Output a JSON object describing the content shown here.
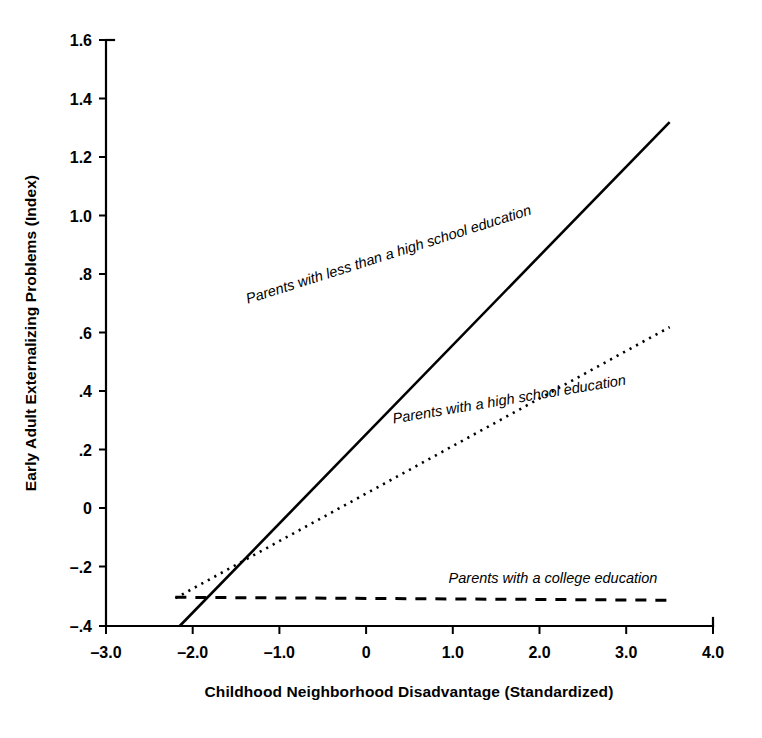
{
  "chart_data": {
    "type": "line",
    "title": "",
    "xlabel": "Childhood Neighborhood Disadvantage (Standardized)",
    "ylabel": "Early Adult Externalizing Problems (Index)",
    "xlim": [
      -3.0,
      4.0
    ],
    "ylim": [
      -0.4,
      1.6
    ],
    "xticks": [
      -3.0,
      -2.0,
      -1.0,
      0,
      1.0,
      2.0,
      3.0,
      4.0
    ],
    "xtick_labels": [
      "–3.0",
      "–2.0",
      "–1.0",
      "0",
      "1.0",
      "2.0",
      "3.0",
      "4.0"
    ],
    "yticks": [
      -0.4,
      -0.2,
      0,
      0.2,
      0.4,
      0.6,
      0.8,
      1.0,
      1.2,
      1.4,
      1.6
    ],
    "ytick_labels": [
      "–.4",
      "–.2",
      "0",
      ".2",
      ".4",
      ".6",
      ".8",
      "1.0",
      "1.2",
      "1.4",
      "1.6"
    ],
    "grid": false,
    "legend_position": "inline-on-line",
    "series": [
      {
        "name": "Parents with less than a high school education",
        "label": "Parents with less than a high school education",
        "style": "solid",
        "x": [
          -2.15,
          3.5
        ],
        "values": [
          -0.4,
          1.32
        ],
        "slope": 0.3046,
        "intercept": 0.2548
      },
      {
        "name": "Parents with a high school education",
        "label": "Parents with a high school education",
        "style": "dotted",
        "x": [
          -2.2,
          3.5
        ],
        "values": [
          -0.305,
          0.62
        ],
        "slope": 0.1623,
        "intercept": 0.052
      },
      {
        "name": "Parents with a college education",
        "label": "Parents with a college education",
        "style": "dashed",
        "x": [
          -2.2,
          3.5
        ],
        "values": [
          -0.302,
          -0.312
        ],
        "slope": -0.0018,
        "intercept": -0.306
      }
    ]
  },
  "axes": {
    "x_axis_title": "Childhood Neighborhood Disadvantage (Standardized)",
    "y_axis_title": "Early Adult Externalizing Problems (Index)"
  },
  "labels": {
    "series_0": "Parents with less than a high school education",
    "series_1": "Parents with a high school education",
    "series_2": "Parents with a college education"
  },
  "ticks": {
    "x": [
      "–3.0",
      "–2.0",
      "–1.0",
      "0",
      "1.0",
      "2.0",
      "3.0",
      "4.0"
    ],
    "y": [
      "1.6",
      "1.4",
      "1.2",
      "1.0",
      ".8",
      ".6",
      ".4",
      ".2",
      "0",
      "–.2",
      "–.4"
    ]
  },
  "colors": {
    "ink": "#000000",
    "background": "#ffffff"
  }
}
